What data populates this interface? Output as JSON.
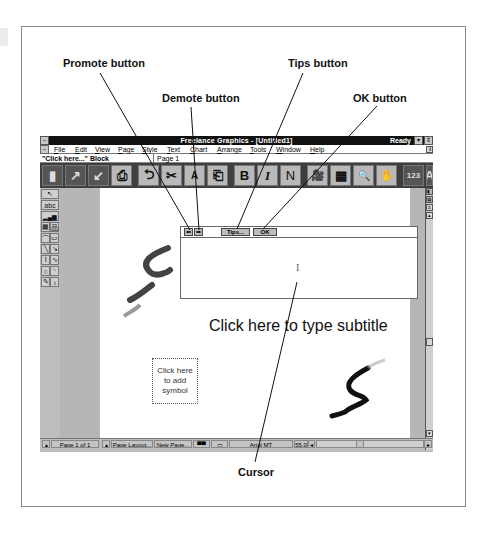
{
  "callouts": {
    "promote": "Promote button",
    "demote": "Demote button",
    "tips": "Tips button",
    "ok": "OK button",
    "cursor": "Cursor"
  },
  "window": {
    "title": "Freelance Graphics - [Untitled1]",
    "status": "Ready",
    "minimize_glyph": "▾",
    "restore_glyph": "⇕"
  },
  "menu": {
    "items": [
      "File",
      "Edit",
      "View",
      "Page",
      "Style",
      "Text",
      "Chart",
      "Arrange",
      "Tools",
      "Window",
      "Help"
    ]
  },
  "status_line": {
    "selection": "\"Click here...\" Block",
    "page": "Page 1"
  },
  "toolbar": {
    "buttons": [
      {
        "name": "smarticon-new",
        "glyph": "▮"
      },
      {
        "name": "smarticon-open",
        "glyph": "↗"
      },
      {
        "name": "smarticon-save",
        "glyph": "↙"
      },
      {
        "name": "smarticon-print",
        "glyph": "⎙"
      },
      {
        "name": "smarticon-undo",
        "glyph": "⮌"
      },
      {
        "name": "smarticon-cut",
        "glyph": "✂"
      },
      {
        "name": "smarticon-replace-text",
        "glyph": "A"
      },
      {
        "name": "smarticon-paste",
        "glyph": "⎗"
      },
      {
        "name": "smarticon-bold",
        "glyph": "B"
      },
      {
        "name": "smarticon-italic",
        "glyph": "I"
      },
      {
        "name": "smarticon-normal",
        "glyph": "N"
      },
      {
        "name": "smarticon-screenshow",
        "glyph": "🎥"
      },
      {
        "name": "smarticon-table",
        "glyph": "▦"
      },
      {
        "name": "smarticon-zoom",
        "glyph": "🔍"
      },
      {
        "name": "smarticon-hand",
        "glyph": "✋"
      },
      {
        "name": "smarticon-chart",
        "glyph": "123"
      },
      {
        "name": "smarticon-symbol",
        "glyph": "A"
      },
      {
        "name": "smarticon-list",
        "glyph": "☰"
      }
    ]
  },
  "toolbox": {
    "tools": [
      {
        "name": "pointer-tool",
        "glyph": "↖"
      },
      {
        "name": "text-tool",
        "glyph": "abc"
      },
      {
        "name": "chart-tool",
        "glyph": "▂▄▆"
      },
      {
        "name": "table-tool",
        "glyph": "▦"
      },
      {
        "name": "org-chart-tool",
        "glyph": "品"
      },
      {
        "name": "polygon-tool",
        "glyph": "⌒"
      },
      {
        "name": "rectangle-tool",
        "glyph": "▭"
      },
      {
        "name": "line-tool",
        "glyph": "╲"
      },
      {
        "name": "arrow-tool",
        "glyph": "↘"
      },
      {
        "name": "polyline-tool",
        "glyph": "⌇"
      },
      {
        "name": "curve-tool",
        "glyph": "∿"
      },
      {
        "name": "circle-tool",
        "glyph": "○"
      },
      {
        "name": "arc-tool",
        "glyph": "◝"
      },
      {
        "name": "freehand-tool",
        "glyph": "✎"
      },
      {
        "name": "symbol-tool",
        "glyph": "♁"
      }
    ]
  },
  "text_block": {
    "promote_glyph": "⇐",
    "demote_glyph": "⇒",
    "tips_label": "Tips...",
    "ok_label": "OK",
    "cursor_glyph": "I"
  },
  "page": {
    "subtitle_placeholder": "Click here to type subtitle",
    "symbol_placeholder": "Click here to add symbol"
  },
  "status_bar": {
    "page_label": "Page 1 of 1",
    "page_layout": "Page Layout...",
    "new_page": "New Page...",
    "font": "Arial MT",
    "size": "55.0"
  }
}
